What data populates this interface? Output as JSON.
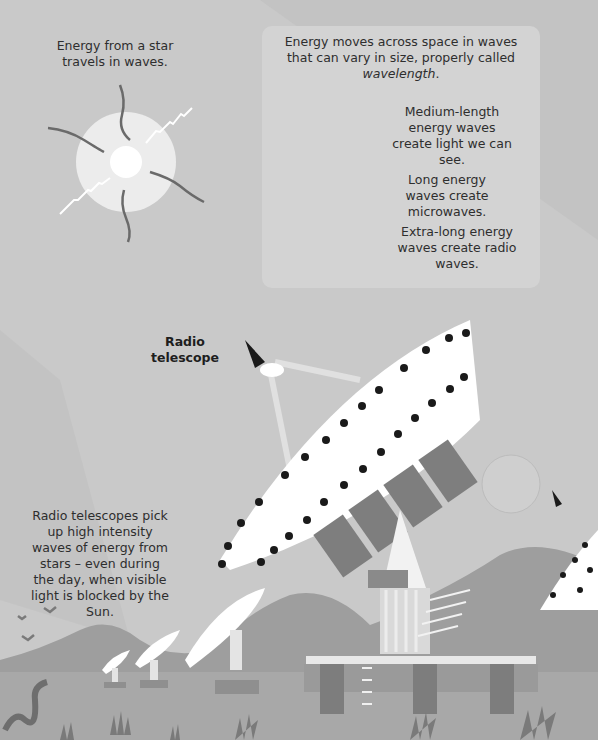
{
  "star_section": {
    "caption": "Energy from a star travels in waves."
  },
  "info_box": {
    "intro_text": "Energy moves across space in waves that can vary in size, properly called ",
    "intro_term": "wavelength",
    "intro_end": ".",
    "waves": [
      {
        "icon": "short-wave-icon",
        "label": "Medium-length energy waves create light we can see."
      },
      {
        "icon": "long-wave-icon",
        "label": "Long energy waves create microwaves."
      },
      {
        "icon": "extra-long-wave-icon",
        "label": "Extra-long energy waves create radio waves."
      }
    ]
  },
  "telescope_section": {
    "label": "Radio telescope",
    "caption": "Radio telescopes pick up high intensity waves of energy from stars – even during the day, when visible light is blocked by the Sun."
  },
  "colors": {
    "background": "#c9c9c9",
    "box": "#d3d3d3",
    "hills": "#9a9a9a",
    "ground": "#a9a9a9",
    "dish": "#ffffff",
    "dots": "#1a1a1a"
  }
}
